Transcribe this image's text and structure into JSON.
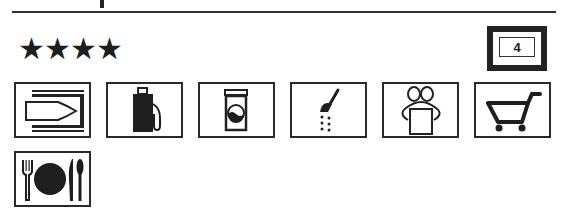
{
  "header": {
    "rating_stars": "★★★★",
    "rating_count": 4,
    "category_badge": "4"
  },
  "facilities": [
    {
      "name": "marina",
      "icon": "boat-berth-icon"
    },
    {
      "name": "fuel",
      "icon": "fuel-pump-icon"
    },
    {
      "name": "laundry",
      "icon": "washing-machine-icon"
    },
    {
      "name": "showers",
      "icon": "shower-icon"
    },
    {
      "name": "gifts",
      "icon": "gift-icon"
    },
    {
      "name": "shop",
      "icon": "shopping-cart-icon"
    },
    {
      "name": "restaurant",
      "icon": "restaurant-icon"
    }
  ],
  "colors": {
    "ink": "#1e1e1e",
    "background": "#ffffff"
  }
}
